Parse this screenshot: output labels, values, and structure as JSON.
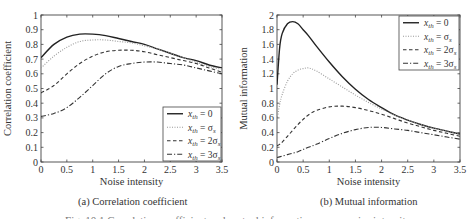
{
  "chart_data": [
    {
      "type": "line",
      "panel": "a",
      "title": "",
      "subcaption": "(a) Correlation coefficient",
      "xlabel": "Noise intensity",
      "ylabel": "Correlation coefficient",
      "xlim": [
        0,
        3.5
      ],
      "ylim": [
        0,
        1
      ],
      "xticks": [
        0,
        0.5,
        1,
        1.5,
        2,
        2.5,
        3,
        3.5
      ],
      "xtick_labels": [
        "0",
        "0.5",
        "1",
        "1.5",
        "2",
        "2.5",
        "3",
        "3.5"
      ],
      "yticks": [
        0,
        0.1,
        0.2,
        0.3,
        0.4,
        0.5,
        0.6,
        0.7,
        0.8,
        0.9,
        1
      ],
      "ytick_labels": [
        "0",
        "0.1",
        "0.2",
        "0.3",
        "0.4",
        "0.5",
        "0.6",
        "0.7",
        "0.8",
        "0.9",
        "1"
      ],
      "grid": false,
      "legend_position": "lower right",
      "x": [
        0,
        0.25,
        0.5,
        0.75,
        1,
        1.25,
        1.5,
        1.75,
        2,
        2.25,
        2.5,
        2.75,
        3,
        3.25,
        3.5
      ],
      "series": [
        {
          "name": "x_th = 0",
          "label_main": "x",
          "label_sub": "th",
          "label_rhs": " = 0",
          "style": "solid",
          "color": "#222222",
          "values": [
            0.71,
            0.8,
            0.85,
            0.87,
            0.87,
            0.86,
            0.84,
            0.82,
            0.8,
            0.77,
            0.74,
            0.71,
            0.69,
            0.66,
            0.64
          ]
        },
        {
          "name": "x_th = σ_s",
          "label_main": "x",
          "label_sub": "th",
          "label_rhs": " = σ",
          "label_rhs_sub": "s",
          "style": "dotted",
          "color": "#999999",
          "values": [
            0.64,
            0.72,
            0.78,
            0.82,
            0.83,
            0.83,
            0.82,
            0.81,
            0.79,
            0.77,
            0.74,
            0.71,
            0.68,
            0.65,
            0.63
          ]
        },
        {
          "name": "x_th = 2σ_s",
          "label_main": "x",
          "label_sub": "th",
          "label_rhs": " = 2σ",
          "label_rhs_sub": "s",
          "style": "dashed",
          "color": "#333333",
          "values": [
            0.47,
            0.52,
            0.6,
            0.67,
            0.72,
            0.75,
            0.76,
            0.76,
            0.75,
            0.73,
            0.71,
            0.69,
            0.67,
            0.64,
            0.61
          ]
        },
        {
          "name": "x_th = 3σ_s",
          "label_main": "x",
          "label_sub": "th",
          "label_rhs": " = 3σ",
          "label_rhs_sub": "s",
          "style": "dashdot",
          "color": "#333333",
          "values": [
            0.31,
            0.33,
            0.37,
            0.44,
            0.52,
            0.6,
            0.65,
            0.67,
            0.68,
            0.68,
            0.67,
            0.66,
            0.64,
            0.62,
            0.6
          ]
        }
      ]
    },
    {
      "type": "line",
      "panel": "b",
      "title": "",
      "subcaption": "(b) Mutual information",
      "xlabel": "Noise intensity",
      "ylabel": "Mutual information",
      "xlim": [
        0,
        3.5
      ],
      "ylim": [
        0,
        2
      ],
      "xticks": [
        0,
        0.5,
        1,
        1.5,
        2,
        2.5,
        3,
        3.5
      ],
      "xtick_labels": [
        "0",
        "0.5",
        "1",
        "1.5",
        "2",
        "2.5",
        "3",
        "3.5"
      ],
      "yticks": [
        0,
        0.2,
        0.4,
        0.6,
        0.8,
        1,
        1.2,
        1.4,
        1.6,
        1.8,
        2
      ],
      "ytick_labels": [
        "0",
        "0.2",
        "0.4",
        "0.6",
        "0.8",
        "1",
        "1.2",
        "1.4",
        "1.6",
        "1.8",
        "2"
      ],
      "grid": false,
      "legend_position": "upper right",
      "x": [
        0,
        0.05,
        0.1,
        0.2,
        0.3,
        0.4,
        0.5,
        0.6,
        0.75,
        1,
        1.25,
        1.5,
        1.75,
        2,
        2.25,
        2.5,
        2.75,
        3,
        3.25,
        3.5
      ],
      "series": [
        {
          "name": "x_th = 0",
          "label_main": "x",
          "label_sub": "th",
          "label_rhs": " = 0",
          "style": "solid",
          "color": "#222222",
          "values": [
            1.05,
            1.55,
            1.75,
            1.88,
            1.91,
            1.88,
            1.8,
            1.72,
            1.58,
            1.36,
            1.16,
            0.99,
            0.85,
            0.74,
            0.64,
            0.57,
            0.51,
            0.46,
            0.42,
            0.38
          ]
        },
        {
          "name": "x_th = σ_s",
          "label_main": "x",
          "label_sub": "th",
          "label_rhs": " = σ",
          "label_rhs_sub": "s",
          "style": "dotted",
          "color": "#999999",
          "values": [
            0.58,
            0.78,
            0.92,
            1.1,
            1.2,
            1.25,
            1.27,
            1.28,
            1.24,
            1.13,
            1.02,
            0.91,
            0.81,
            0.72,
            0.64,
            0.57,
            0.51,
            0.46,
            0.42,
            0.38
          ]
        },
        {
          "name": "x_th = 2σ_s",
          "label_main": "x",
          "label_sub": "th",
          "label_rhs": " = 2σ",
          "label_rhs_sub": "s",
          "style": "dashed",
          "color": "#333333",
          "values": [
            0.22,
            0.24,
            0.27,
            0.35,
            0.43,
            0.51,
            0.58,
            0.64,
            0.7,
            0.75,
            0.76,
            0.74,
            0.7,
            0.65,
            0.59,
            0.53,
            0.48,
            0.43,
            0.39,
            0.35
          ]
        },
        {
          "name": "x_th = 3σ_s",
          "label_main": "x",
          "label_sub": "th",
          "label_rhs": " = 3σ",
          "label_rhs_sub": "s",
          "style": "dashdot",
          "color": "#333333",
          "values": [
            0.06,
            0.07,
            0.08,
            0.1,
            0.12,
            0.14,
            0.17,
            0.2,
            0.24,
            0.32,
            0.39,
            0.44,
            0.47,
            0.47,
            0.45,
            0.43,
            0.4,
            0.37,
            0.34,
            0.31
          ]
        }
      ]
    }
  ],
  "figure_caption": "Fig. 10.1 Correlation coefficient and mutual information versus noise intensity"
}
